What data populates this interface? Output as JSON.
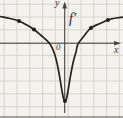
{
  "figure": {
    "function_label": "f′",
    "axis_x_label": "x",
    "axis_y_label": "y",
    "origin_label": "0"
  },
  "colors": {
    "background": "#f3f2ee",
    "grid": "#c9c9c3",
    "axis": "#45453f",
    "curve": "#24241f",
    "dot": "#1c1c18"
  },
  "chart_data": {
    "type": "line",
    "xlabel": "x",
    "ylabel": "y",
    "x_range": [
      -5.05,
      4.56
    ],
    "y_range": [
      -5.84,
      3.38
    ],
    "grid": "on",
    "grid_spacing_units": 1,
    "series": [
      {
        "name": "f′",
        "points": [
          [
            -5.05,
            2.09
          ],
          [
            -4.27,
            1.94
          ],
          [
            -3.57,
            1.74
          ],
          [
            -2.95,
            1.43
          ],
          [
            -2.4,
            1.08
          ],
          [
            -1.93,
            0.69
          ],
          [
            -1.54,
            0.34
          ],
          [
            -1.15,
            -0.05
          ],
          [
            -0.84,
            -0.68
          ],
          [
            -0.6,
            -1.54
          ],
          [
            -0.41,
            -2.55
          ],
          [
            -0.21,
            -3.73
          ],
          [
            -0.09,
            -4.31
          ],
          [
            0.02,
            -4.51
          ],
          [
            0.14,
            -4.31
          ],
          [
            0.26,
            -3.73
          ],
          [
            0.45,
            -2.55
          ],
          [
            0.65,
            -1.54
          ],
          [
            0.88,
            -0.68
          ],
          [
            1.04,
            -0.05
          ],
          [
            1.51,
            0.57
          ],
          [
            2.05,
            1.2
          ],
          [
            2.76,
            1.55
          ],
          [
            3.38,
            1.82
          ],
          [
            4.01,
            1.98
          ],
          [
            4.56,
            2.05
          ]
        ]
      }
    ],
    "marked_points": [
      [
        -3.57,
        1.74
      ],
      [
        -2.4,
        1.08
      ],
      [
        0.02,
        -4.51
      ],
      [
        2.05,
        1.2
      ],
      [
        3.38,
        1.82
      ]
    ]
  }
}
